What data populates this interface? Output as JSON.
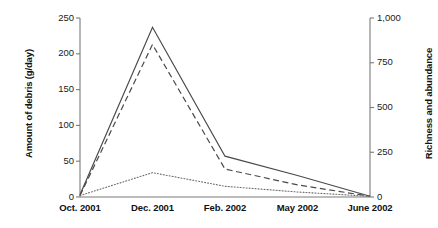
{
  "chart_data": {
    "type": "line",
    "title": "",
    "xlabel": "",
    "categories": [
      "Oct. 2001",
      "Dec. 2001",
      "Feb. 2002",
      "May 2002",
      "June 2002"
    ],
    "grid": false,
    "legend": "none",
    "axes": {
      "left": {
        "label": "Amount of debris (g/day)",
        "ylim": [
          0,
          250
        ],
        "ticks": [
          0,
          50,
          100,
          150,
          200,
          250
        ],
        "tick_labels": [
          "0",
          "50",
          "100",
          "150",
          "200",
          "250"
        ]
      },
      "right": {
        "label": "Richness and abundance",
        "ylim": [
          0,
          1000
        ],
        "ticks": [
          0,
          250,
          500,
          750,
          1000
        ],
        "tick_labels": [
          "0",
          "250",
          "500",
          "750",
          "1,000"
        ]
      }
    },
    "series": [
      {
        "name": "solid-series",
        "style": "solid",
        "axis": "left",
        "color": "#4a4a4a",
        "values": [
          3,
          237,
          57,
          30,
          1
        ]
      },
      {
        "name": "dashed-series",
        "style": "dashed",
        "axis": "left",
        "color": "#4a4a4a",
        "values": [
          2,
          213,
          39,
          17,
          1
        ]
      },
      {
        "name": "dotted-series",
        "style": "dotted",
        "axis": "left",
        "color": "#6b6b6b",
        "values": [
          2,
          34,
          15,
          7,
          1
        ]
      }
    ]
  },
  "colors": {
    "axis": "#7a7a7a",
    "text": "#1a1a1a",
    "background": "#ffffff"
  }
}
